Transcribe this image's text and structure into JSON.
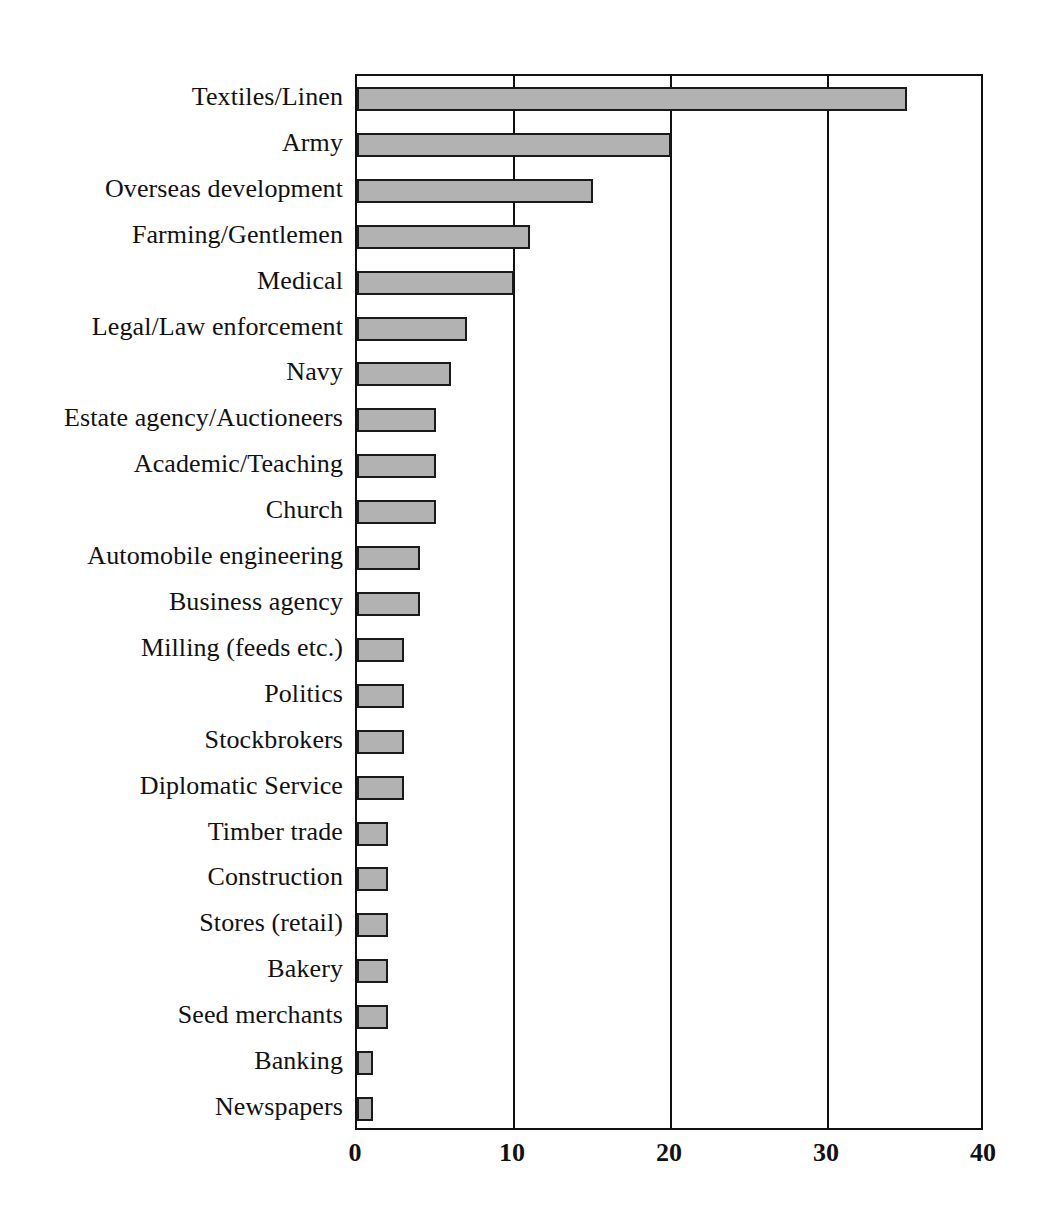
{
  "chart_data": {
    "type": "bar",
    "orientation": "horizontal",
    "title": "",
    "xlabel": "",
    "ylabel": "",
    "xlim": [
      0,
      40
    ],
    "xticks": [
      "0",
      "10",
      "20",
      "30",
      "40"
    ],
    "xtick_values": [
      0,
      10,
      20,
      30,
      40
    ],
    "grid": "vertical",
    "legend": "none",
    "categories": [
      "Textiles/Linen",
      "Army",
      "Overseas development",
      "Farming/Gentlemen",
      "Medical",
      "Legal/Law enforcement",
      "Navy",
      "Estate agency/Auctioneers",
      "Academic/Teaching",
      "Church",
      "Automobile engineering",
      "Business agency",
      "Milling (feeds etc.)",
      "Politics",
      "Stockbrokers",
      "Diplomatic Service",
      "Timber trade",
      "Construction",
      "Stores (retail)",
      "Bakery",
      "Seed merchants",
      "Banking",
      "Newspapers"
    ],
    "values": [
      35,
      20,
      15,
      11,
      10,
      7,
      6,
      5,
      5,
      5,
      4,
      4,
      3,
      3,
      3,
      3,
      2,
      2,
      2,
      2,
      2,
      1,
      1
    ]
  },
  "style": {
    "bar_fill": "#b2b2b2",
    "bar_stroke": "#1a1a1a",
    "axis_color": "#111111",
    "background": "#ffffff"
  }
}
